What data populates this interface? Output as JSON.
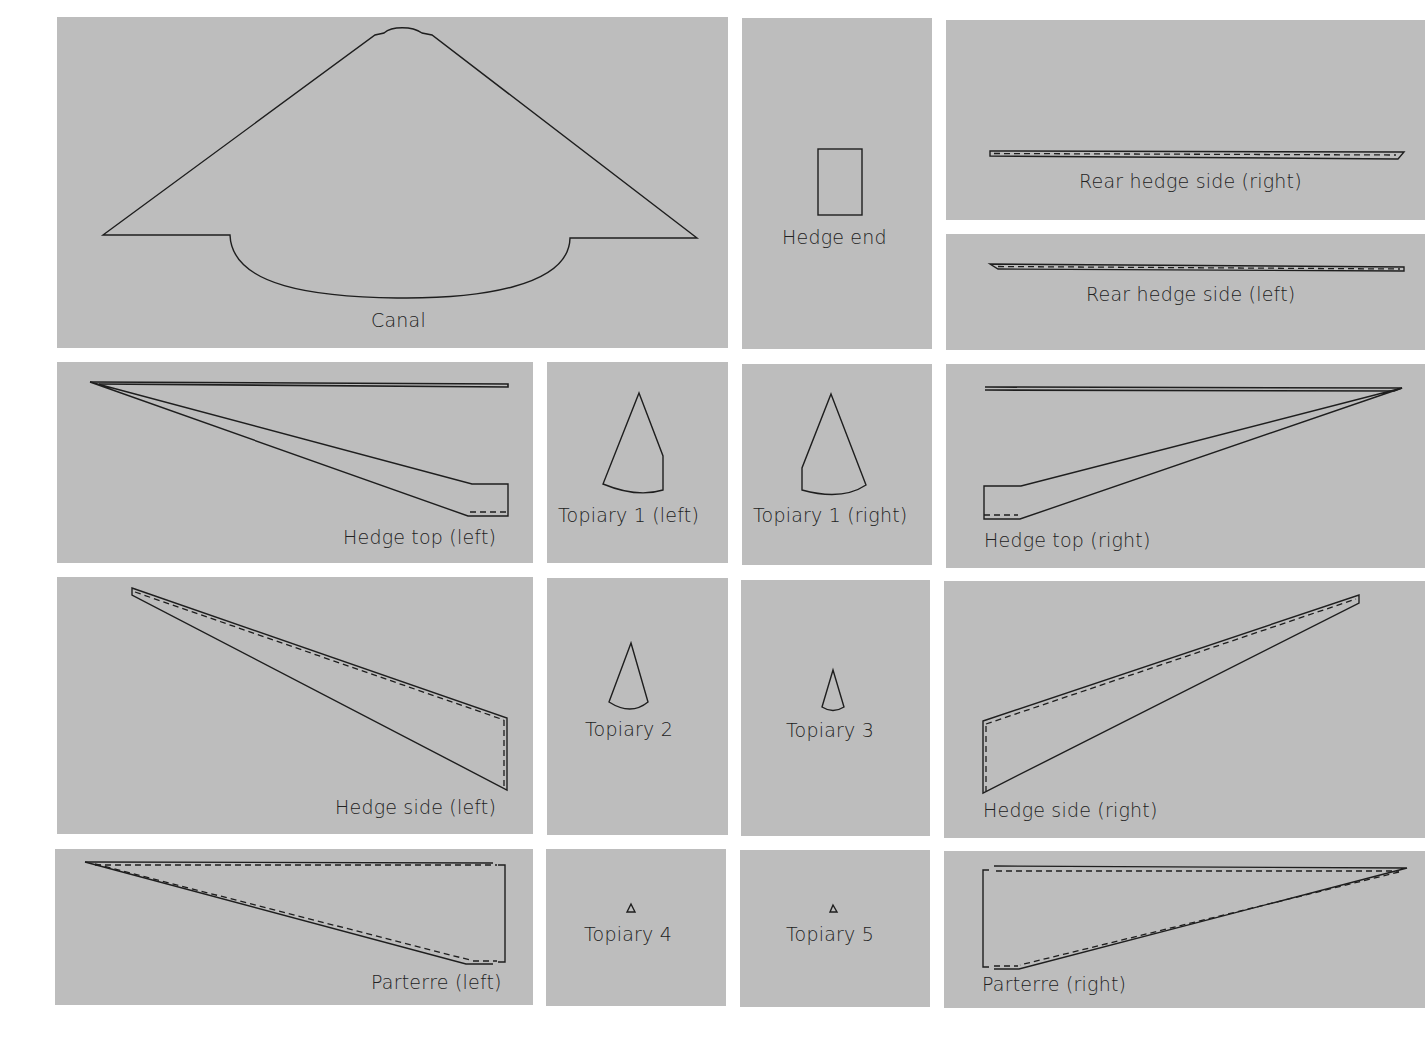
{
  "diagram": {
    "background_color": "#ffffff",
    "panel_color": "#bdbdbd",
    "line_color": "#1e1e1e",
    "pieces": [
      {
        "id": "canal",
        "label": "Canal"
      },
      {
        "id": "hedge-end",
        "label": "Hedge end"
      },
      {
        "id": "rear-hedge-side-right",
        "label": "Rear hedge side (right)"
      },
      {
        "id": "rear-hedge-side-left",
        "label": "Rear hedge side (left)"
      },
      {
        "id": "hedge-top-left",
        "label": "Hedge top (left)"
      },
      {
        "id": "topiary-1-left",
        "label": "Topiary 1 (left)"
      },
      {
        "id": "topiary-1-right",
        "label": "Topiary 1 (right)"
      },
      {
        "id": "hedge-top-right",
        "label": "Hedge top (right)"
      },
      {
        "id": "hedge-side-left",
        "label": "Hedge side (left)"
      },
      {
        "id": "topiary-2",
        "label": "Topiary 2"
      },
      {
        "id": "topiary-3",
        "label": "Topiary 3"
      },
      {
        "id": "hedge-side-right",
        "label": "Hedge side (right)"
      },
      {
        "id": "parterre-left",
        "label": "Parterre (left)"
      },
      {
        "id": "topiary-4",
        "label": "Topiary 4"
      },
      {
        "id": "topiary-5",
        "label": "Topiary 5"
      },
      {
        "id": "parterre-right",
        "label": "Parterre (right)"
      }
    ]
  }
}
